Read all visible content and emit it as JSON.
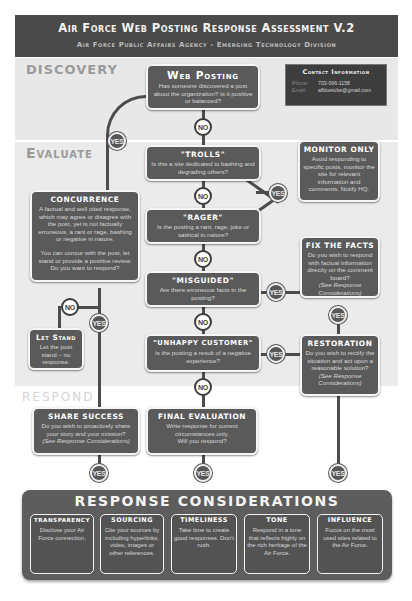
{
  "header": {
    "title": "Air Force Web Posting Response Assessment V.2",
    "subtitle": "Air Force Public Affairs Agency - Emerging Technology Division"
  },
  "zones": {
    "discovery": "DISCOVERY",
    "evaluate": "Evaluate",
    "respond": "Respond"
  },
  "contact": {
    "title": "Contact Information",
    "phone_label": "Phone:",
    "phone": "703-696-1158",
    "email_label": "Email:",
    "email": "afbluetube@gmail.com"
  },
  "nodes": {
    "web_posting": {
      "title": "Web Posting",
      "text": "Has someone discovered a post about the organization? Is it positive or balanced?"
    },
    "trolls": {
      "title": "\"Trolls\"",
      "text": "Is this a site dedicated to bashing and degrading others?"
    },
    "rager": {
      "title": "\"Rager\"",
      "text": "Is the posting a rant, rage, joke or satirical in nature?"
    },
    "misguided": {
      "title": "\"Misguided\"",
      "text": "Are there erroneous facts in the posting?"
    },
    "unhappy": {
      "title": "\"Unhappy Customer\"",
      "text": "Is the posting a result of a negative experience?"
    },
    "monitor": {
      "title": "Monitor Only",
      "text": "Avoid responding to specific posts, monitor the site for relevant information and comments. Notify HQ."
    },
    "fix_facts": {
      "title": "Fix the Facts",
      "text": "Do you wish to respond with factual information directly on the comment board?",
      "note": "(See Response Considerations)"
    },
    "restoration": {
      "title": "Restoration",
      "text": "Do you wish to rectify the situation and act upon a reasonable solution?",
      "note": "(See Response Considerations)"
    },
    "concurrence": {
      "title": "Concurrence",
      "text": "A factual and well cited response, which may agree or disagree with the post, yet is not factually erroneous, a rant or rage, bashing or negative in nature.",
      "text2": "You can concur with the post, let stand or provide a positive review. Do you want to respond?"
    },
    "let_stand": {
      "title": "Let Stand",
      "text": "Let the post stand – no response."
    },
    "share_success": {
      "title": "Share Success",
      "text": "Do you wish to proactively share your story and your mission?",
      "note": "(See Response Considerations)"
    },
    "final_eval": {
      "title": "Final Evaluation",
      "text": "Write response for current circumstances only.",
      "text2": "Will you respond?"
    }
  },
  "badges": {
    "yes": "YES",
    "no": "NO"
  },
  "considerations": {
    "title": "Response Considerations",
    "items": [
      {
        "title": "Transparency",
        "text": "Disclose your Air Force connection."
      },
      {
        "title": "Sourcing",
        "text": "Cite your sources by including hyperlinks, video, images or other references."
      },
      {
        "title": "Timeliness",
        "text": "Take time to create good responses. Don't rush."
      },
      {
        "title": "Tone",
        "text": "Respond in a tone that reflects highly on the rich heritage of the Air Force."
      },
      {
        "title": "Influence",
        "text": "Focus on the most used sites related to the Air Force."
      }
    ]
  },
  "colors": {
    "box": "#5a5a5a",
    "header": "#4a4a4a",
    "zone": "#e8e8e8"
  }
}
